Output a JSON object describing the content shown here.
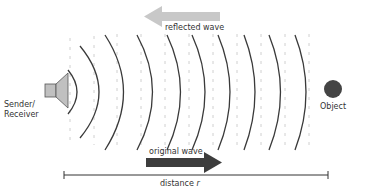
{
  "diagram": {
    "labels": {
      "sender": "Sender/",
      "receiver": "Receiver",
      "object": "Object",
      "reflected_wave": "reflected wave",
      "original_wave": "original wave",
      "distance": "distance ",
      "distance_var": "r"
    },
    "icons": {
      "sender": "speaker-icon",
      "object": "circle-object-icon",
      "reflected_arrow": "arrow-left-icon",
      "original_arrow": "arrow-right-icon"
    },
    "colors": {
      "wave_line": "#3a3a3a",
      "dashed_line": "#d0d0d0",
      "reflected_arrow": "#c8c8c8",
      "original_arrow": "#3d3d3d",
      "object": "#444444",
      "speaker_fill": "#c0c0c0",
      "text": "#333333"
    },
    "wave_count": 9
  }
}
